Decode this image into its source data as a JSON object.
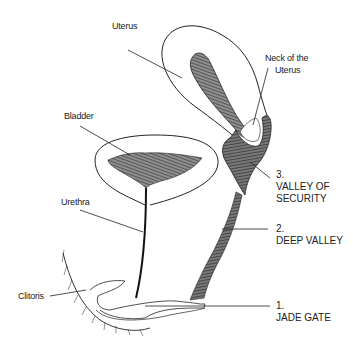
{
  "diagram": {
    "type": "anatomical-line-drawing",
    "labels": {
      "uterus": "Uterus",
      "neck_line1": "Neck of the",
      "neck_line2": "Uterus",
      "bladder": "Bladder",
      "urethra": "Urethra",
      "clitoris": "Clitoris"
    },
    "stages": [
      {
        "number": "3.",
        "line1": "VALLEY OF",
        "line2": "SECURITY"
      },
      {
        "number": "2.",
        "line1": "DEEP  VALLEY",
        "line2": ""
      },
      {
        "number": "1.",
        "line1": "JADE GATE",
        "line2": ""
      }
    ],
    "colors": {
      "ink": "#222222",
      "background": "#ffffff"
    }
  }
}
